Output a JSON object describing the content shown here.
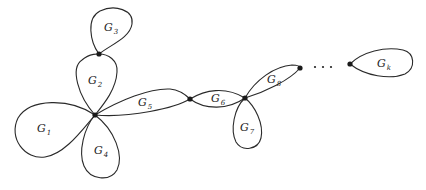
{
  "diagram": {
    "type": "block-graph",
    "vertices": [
      {
        "id": "v_top",
        "x": 99,
        "y": 54
      },
      {
        "id": "v_center",
        "x": 95,
        "y": 115
      },
      {
        "id": "v_mid",
        "x": 190,
        "y": 99
      },
      {
        "id": "v_right",
        "x": 245,
        "y": 98
      },
      {
        "id": "v_g8_end",
        "x": 300,
        "y": 68
      },
      {
        "id": "v_gk",
        "x": 350,
        "y": 64
      }
    ],
    "blocks": [
      {
        "name": "G",
        "sub": "1",
        "label_x": 40,
        "label_y": 132
      },
      {
        "name": "G",
        "sub": "2",
        "label_x": 88,
        "label_y": 84
      },
      {
        "name": "G",
        "sub": "3",
        "label_x": 106,
        "label_y": 31
      },
      {
        "name": "G",
        "sub": "4",
        "label_x": 96,
        "label_y": 154
      },
      {
        "name": "G",
        "sub": "5",
        "label_x": 139,
        "label_y": 106
      },
      {
        "name": "G",
        "sub": "6",
        "label_x": 212,
        "label_y": 102
      },
      {
        "name": "G",
        "sub": "7",
        "label_x": 240,
        "label_y": 131
      },
      {
        "name": "G",
        "sub": "8",
        "label_x": 267,
        "label_y": 83
      },
      {
        "name": "G",
        "sub": "k",
        "label_x": 376,
        "label_y": 67
      }
    ],
    "ellipsis": {
      "text": "· · ·",
      "dots": [
        [
          315,
          67
        ],
        [
          323,
          67
        ],
        [
          331,
          67
        ]
      ]
    }
  }
}
